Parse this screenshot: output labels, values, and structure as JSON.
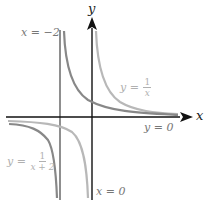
{
  "figure": {
    "axes": {
      "x_label": "x",
      "y_label": "y"
    },
    "labels": {
      "asymptote_x_neg2": "x = −2",
      "asymptote_x_0": "x = 0",
      "asymptote_y_0": "y = 0",
      "curve_1_over_x": {
        "lhs": "y =",
        "num": "1",
        "den": "x"
      },
      "curve_1_over_x_plus_2": {
        "lhs": "y =",
        "num": "1",
        "den": "x + 2"
      }
    },
    "colors": {
      "axis": "#111111",
      "asymptote": "#444444",
      "curve_dark": "#888888",
      "curve_light": "#b8b8b8",
      "label_light": "#b0b0b0",
      "label_mid": "#777777"
    }
  }
}
